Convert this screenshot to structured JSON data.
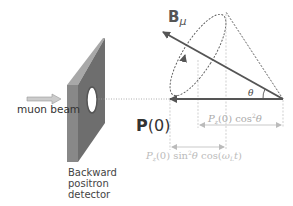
{
  "diagram": {
    "labels": {
      "muon_beam": "muon beam",
      "detector_line1": "Backward",
      "detector_line2": "positron",
      "detector_line3": "detector",
      "polarization_bold": "P",
      "polarization_arg": "(0)",
      "field_symbol": "B",
      "field_subscript": "μ",
      "angle": "θ",
      "longitudinal_component": {
        "P": "P",
        "sub": "z",
        "rest": "(0) cos",
        "sup": "2",
        "angle": "θ"
      },
      "oscillating_component": {
        "P": "P",
        "sub": "z",
        "mid": "(0) sin",
        "sup": "2",
        "angle": "θ",
        "cos": " cos(",
        "omega": "ω",
        "omega_sub": "L",
        "t": "t",
        "close": ")"
      }
    },
    "colors": {
      "detector_front": "#808080",
      "detector_side": "#666666",
      "detector_top": "#999999",
      "vector_arrow": "#555555",
      "dashed_lines": "#555555",
      "dimension_lines": "#bbbbbb",
      "beam_arrow": "#aaaaaa"
    }
  }
}
